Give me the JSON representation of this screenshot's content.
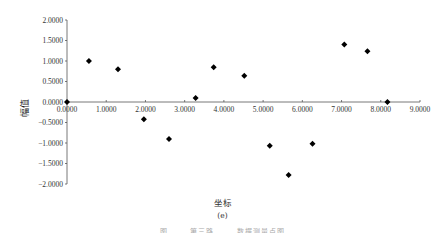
{
  "chart_data": {
    "type": "scatter",
    "title": "",
    "xlabel": "坐标",
    "ylabel": "幅值",
    "subfigure_label": "(e)",
    "xlim": [
      0,
      9
    ],
    "ylim": [
      -2,
      2
    ],
    "grid": false,
    "legend": null,
    "marker": "diamond",
    "marker_color": "#000000",
    "x_ticks": [
      "0.0000",
      "1.0000",
      "2.0000",
      "3.0000",
      "4.0000",
      "5.0000",
      "6.0000",
      "7.0000",
      "8.0000",
      "9.0000"
    ],
    "y_ticks": [
      "2.0000",
      "1.5000",
      "1.0000",
      "0.5000",
      "0.0000",
      "-0.5000",
      "-1.0000",
      "-1.5000",
      "-2.0000"
    ],
    "points": [
      {
        "x": 0.0,
        "y": 0.0
      },
      {
        "x": 0.56,
        "y": 1.0
      },
      {
        "x": 1.3,
        "y": 0.8
      },
      {
        "x": 1.96,
        "y": -0.42
      },
      {
        "x": 2.6,
        "y": -0.9
      },
      {
        "x": 3.28,
        "y": 0.1
      },
      {
        "x": 3.74,
        "y": 0.85
      },
      {
        "x": 4.52,
        "y": 0.64
      },
      {
        "x": 5.17,
        "y": -1.07
      },
      {
        "x": 5.65,
        "y": -1.78
      },
      {
        "x": 6.26,
        "y": -1.02
      },
      {
        "x": 7.07,
        "y": 1.4
      },
      {
        "x": 7.66,
        "y": 1.24
      },
      {
        "x": 8.17,
        "y": 0.0
      }
    ]
  },
  "caption": {
    "axis_title": "坐标",
    "sublabel": "(e)",
    "cut_off_caption": "图 …… 第三路 …… 数据测量点图"
  }
}
